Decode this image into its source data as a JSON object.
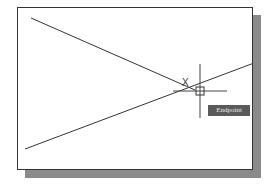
{
  "viewport": {
    "background": "#ffffff",
    "frame_color": "#333333",
    "shadow_color": "#8a8a8a"
  },
  "drawing": {
    "lines": [
      {
        "x1": 13,
        "y1": 10,
        "x2": 177,
        "y2": 82
      },
      {
        "x1": 7,
        "y1": 141,
        "x2": 236,
        "y2": 55
      }
    ],
    "crosshair": {
      "x": 182,
      "y": 83,
      "h_len": 27,
      "v_len": 27
    },
    "snap_marker": {
      "shape": "square",
      "size": 7
    },
    "cursor_glyph": "X"
  },
  "osnap_tooltip": {
    "label": "Endpoint",
    "background": "#5a5a5a"
  }
}
